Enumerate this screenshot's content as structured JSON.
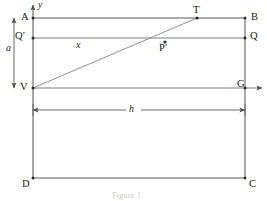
{
  "figure": {
    "caption": "Figure 1",
    "axes": {
      "y_label": "y",
      "x_label": ""
    },
    "vertices": [
      {
        "name": "A",
        "label": "A",
        "x": 33,
        "y": 18,
        "label_x": 21,
        "label_y": 12,
        "dot": true
      },
      {
        "name": "B",
        "label": "B",
        "x": 245,
        "y": 18,
        "label_x": 251,
        "label_y": 12,
        "dot": true
      },
      {
        "name": "C",
        "label": "C",
        "x": 245,
        "y": 178,
        "label_x": 249,
        "label_y": 179,
        "dot": true
      },
      {
        "name": "D",
        "label": "D",
        "x": 33,
        "y": 178,
        "label_x": 22,
        "label_y": 179,
        "dot": true
      },
      {
        "name": "Qprime",
        "label": "Q′",
        "x": 33,
        "y": 38,
        "label_x": 16,
        "label_y": 32,
        "dot": true
      },
      {
        "name": "Q",
        "label": "Q",
        "x": 245,
        "y": 38,
        "label_x": 250,
        "label_y": 32,
        "dot": true
      },
      {
        "name": "V",
        "label": "V",
        "x": 33,
        "y": 88,
        "label_x": 20,
        "label_y": 83,
        "dot": true
      },
      {
        "name": "G",
        "label": "G",
        "x": 245,
        "y": 88,
        "label_x": 238,
        "label_y": 80,
        "dot": true
      },
      {
        "name": "T",
        "label": "T",
        "x": 197,
        "y": 18,
        "label_x": 193,
        "label_y": 6,
        "dot": true
      },
      {
        "name": "Pprime",
        "label": "P′",
        "x": 165,
        "y": 42,
        "label_x": 160,
        "label_y": 44,
        "dot": true
      }
    ],
    "dimensions": [
      {
        "name": "a",
        "label": "a",
        "orientation": "vertical",
        "label_x": 6,
        "label_y": 48
      },
      {
        "name": "h",
        "label": "h",
        "orientation": "horizontal",
        "label_x": 131,
        "label_y": 104
      }
    ],
    "segment_labels": [
      {
        "name": "x",
        "label": "x",
        "label_x": 76,
        "label_y": 40
      }
    ],
    "colors": {
      "line": "#5a5a60",
      "thin_line": "#76767c",
      "text": "#16161a",
      "caption": "#c9c9cd",
      "background": "#ffffff"
    }
  }
}
